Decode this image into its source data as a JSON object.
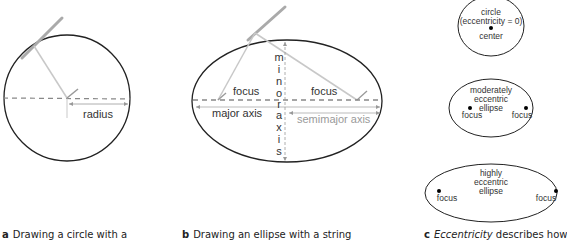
{
  "panel_a": {
    "label": "radius",
    "caption_letter": "a",
    "caption_text": "Drawing a circle with a"
  },
  "panel_b": {
    "labels": {
      "focus_left": "focus",
      "focus_right": "focus",
      "major_axis": "major axis",
      "semimajor_axis": "semimajor axis",
      "minor_axis_letters": [
        "m",
        "i",
        "n",
        "o",
        "r",
        "a",
        "x",
        "i",
        "s"
      ]
    },
    "caption_letter": "b",
    "caption_text": "Drawing an ellipse with a string"
  },
  "panel_c": {
    "circle": {
      "line1": "circle",
      "line2": "(eccentricity = 0)",
      "center_label": "center"
    },
    "moderate": {
      "line1": "moderately",
      "line2": "eccentric",
      "line3": "ellipse",
      "focus_left": "focus",
      "focus_right": "focus"
    },
    "high": {
      "line1": "highly",
      "line2": "eccentric",
      "line3": "ellipse",
      "focus_left": "focus",
      "focus_right": "focus"
    },
    "caption_letter": "c",
    "caption_italic": "Eccentricity",
    "caption_text": "describes how"
  }
}
